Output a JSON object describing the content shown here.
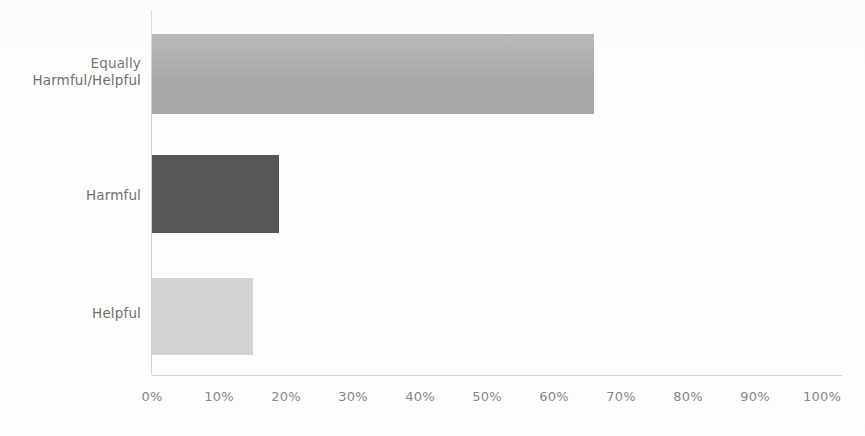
{
  "chart_data": {
    "type": "bar",
    "orientation": "horizontal",
    "title": "",
    "subtitle": "",
    "xlabel": "",
    "ylabel": "",
    "categories": [
      "Equally Harmful/Helpful",
      "Harmful",
      "Helpful"
    ],
    "category_lines": [
      [
        "Equally",
        "Harmful/Helpful"
      ],
      [
        "Harmful"
      ],
      [
        "Helpful"
      ]
    ],
    "values": [
      66,
      19,
      15
    ],
    "value_labels": [
      "66%",
      "19%",
      "15%"
    ],
    "bar_colors": [
      "#a9a9a7",
      "#575757",
      "#d2d2d0"
    ],
    "xlim": [
      0,
      100
    ],
    "xticks": [
      0,
      10,
      20,
      30,
      40,
      50,
      60,
      70,
      80,
      90,
      100
    ],
    "xtick_labels": [
      "0%",
      "10%",
      "20%",
      "30%",
      "40%",
      "50%",
      "60%",
      "70%",
      "80%",
      "90%",
      "100%"
    ],
    "grid": false,
    "legend": false,
    "legend_position": "none",
    "axis_line_color": "#d3d3d1",
    "tick_label_color": "#7c7c7a",
    "category_label_color": "#70706e",
    "background_color": "#fdfdfc"
  },
  "axis": {
    "x": {
      "ticks": [
        {
          "label": "0%",
          "value": 0
        },
        {
          "label": "10%",
          "value": 10
        },
        {
          "label": "20%",
          "value": 20
        },
        {
          "label": "30%",
          "value": 30
        },
        {
          "label": "40%",
          "value": 40
        },
        {
          "label": "50%",
          "value": 50
        },
        {
          "label": "60%",
          "value": 60
        },
        {
          "label": "70%",
          "value": 70
        },
        {
          "label": "80%",
          "value": 80
        },
        {
          "label": "90%",
          "value": 90
        },
        {
          "label": "100%",
          "value": 100
        }
      ]
    },
    "y": {
      "categories": [
        {
          "line1": "Equally",
          "line2": "Harmful/Helpful"
        },
        {
          "line1": "Harmful",
          "line2": ""
        },
        {
          "line1": "Helpful",
          "line2": ""
        }
      ]
    }
  }
}
